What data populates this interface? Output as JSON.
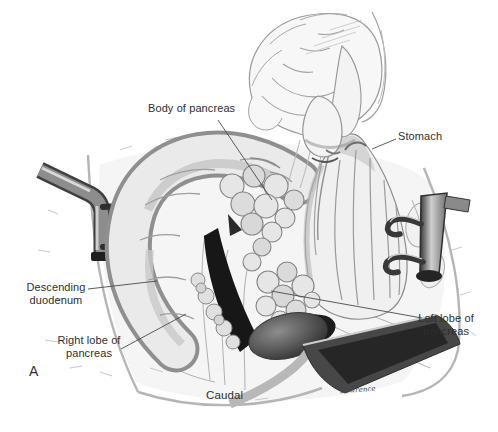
{
  "figure": {
    "panel_label": "A",
    "orientation_caption": "Caudal",
    "artist_signature": "Lawrence"
  },
  "annotations": {
    "body_of_pancreas": "Body of pancreas",
    "stomach": "Stomach",
    "descending_duodenum": "Descending duodenum",
    "right_lobe_of_pancreas": "Right lobe of pancreas",
    "left_lobe_of_pancreas": "Left lobe of pancreas"
  },
  "colors": {
    "ink": "#2e2e2e",
    "leader_line": "#4a4a4a",
    "background": "#ffffff"
  }
}
